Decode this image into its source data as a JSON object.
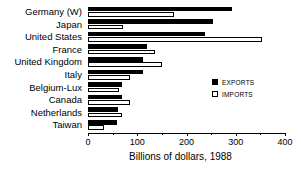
{
  "chart_data": {
    "type": "bar",
    "orientation": "horizontal",
    "title": "",
    "xlabel": "Billions of dollars, 1988",
    "ylabel": "",
    "xlim": [
      0,
      400
    ],
    "xticks": [
      0,
      100,
      200,
      300,
      400
    ],
    "xtick_labels": [
      "0",
      "100",
      "200",
      "300",
      "400"
    ],
    "grid": false,
    "legend_position": "right-middle",
    "categories": [
      "Germany (W)",
      "Japan",
      "United States",
      "France",
      "United Kingdom",
      "Italy",
      "Belgium-Lux",
      "Canada",
      "Netherlands",
      "Taiwan"
    ],
    "series": [
      {
        "name": "EXPORTS",
        "color": "#000000",
        "values": [
          292,
          254,
          237,
          120,
          112,
          112,
          69,
          69,
          61,
          59
        ]
      },
      {
        "name": "IMPORTS",
        "color": "#ffffff",
        "values": [
          175,
          71,
          353,
          136,
          150,
          85,
          63,
          85,
          69,
          33
        ]
      }
    ]
  },
  "legend": {
    "items": [
      {
        "label": "EXPORTS",
        "swatch": "filled"
      },
      {
        "label": "IMPORTS",
        "swatch": "hollow"
      }
    ]
  },
  "axis": {
    "title": "Billions of dollars, 1988"
  }
}
